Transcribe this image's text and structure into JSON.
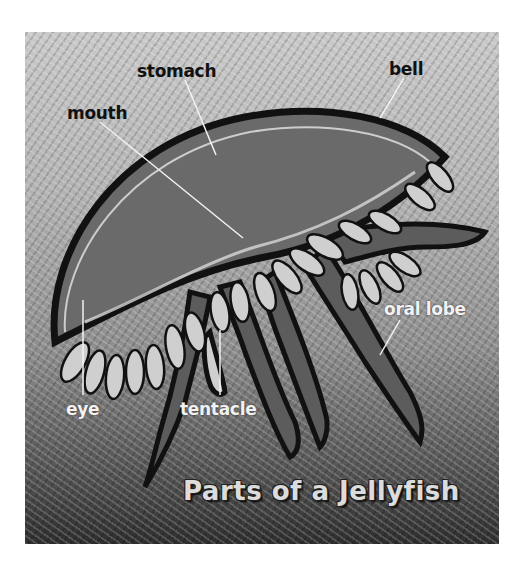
{
  "figure": {
    "title": "Parts of a Jellyfish",
    "labels": {
      "stomach": "stomach",
      "bell": "bell",
      "mouth": "mouth",
      "oral_lobe": "oral lobe",
      "eye": "eye",
      "tentacle": "tentacle"
    },
    "colors": {
      "background_top": "#c9c9c9",
      "background_bottom": "#2e2e2e",
      "bell_fill": "#6e6e6e",
      "outline": "#111111",
      "frill": "#cfcfcf",
      "dark_label": "#111111",
      "light_label": "#f2f2f2"
    }
  }
}
